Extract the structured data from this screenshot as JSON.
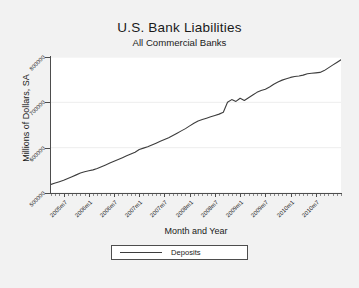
{
  "chart_data": {
    "type": "line",
    "title": "U.S. Bank Liabilities",
    "subtitle": "All Commercial Banks",
    "xlabel": "Month and Year",
    "ylabel": "Millions of Dollars, SA",
    "grid": "horizontal",
    "legend_position": "bottom-center",
    "xlim": [
      "2005m4",
      "2011m1"
    ],
    "ylim": [
      500000,
      800000
    ],
    "ytick_labels": [
      "800000",
      "700000",
      "600000",
      "500000"
    ],
    "ytick_values": [
      800000,
      700000,
      600000,
      500000
    ],
    "xtick_labels": [
      "2005m7",
      "2006m1",
      "2006m7",
      "2007m1",
      "2007m7",
      "2008m1",
      "2008m7",
      "2009m1",
      "2009m7",
      "2010m1",
      "2010m7"
    ],
    "xtick_values": [
      "2005m7",
      "2006m1",
      "2006m7",
      "2007m1",
      "2007m7",
      "2008m1",
      "2008m7",
      "2009m1",
      "2009m7",
      "2010m1",
      "2010m7"
    ],
    "series": [
      {
        "name": "Deposits",
        "color": "#3d3d3d",
        "x": [
          "2005m4",
          "2005m5",
          "2005m6",
          "2005m7",
          "2005m8",
          "2005m9",
          "2005m10",
          "2005m11",
          "2005m12",
          "2006m1",
          "2006m2",
          "2006m3",
          "2006m4",
          "2006m5",
          "2006m6",
          "2006m7",
          "2006m8",
          "2006m9",
          "2006m10",
          "2006m11",
          "2006m12",
          "2007m1",
          "2007m2",
          "2007m3",
          "2007m4",
          "2007m5",
          "2007m6",
          "2007m7",
          "2007m8",
          "2007m9",
          "2007m10",
          "2007m11",
          "2007m12",
          "2008m1",
          "2008m2",
          "2008m3",
          "2008m4",
          "2008m5",
          "2008m6",
          "2008m7",
          "2008m8",
          "2008m9",
          "2008m10",
          "2008m11",
          "2008m12",
          "2009m1",
          "2009m2",
          "2009m3",
          "2009m4",
          "2009m5",
          "2009m6",
          "2009m7",
          "2009m8",
          "2009m9",
          "2009m10",
          "2009m11",
          "2009m12",
          "2010m1",
          "2010m2",
          "2010m3",
          "2010m4",
          "2010m5",
          "2010m6",
          "2010m7",
          "2010m8",
          "2010m9",
          "2010m10",
          "2010m11",
          "2010m12",
          "2011m1"
        ],
        "values": [
          519000,
          522000,
          525000,
          528000,
          532000,
          536000,
          540000,
          544000,
          547000,
          549000,
          551000,
          554000,
          558000,
          562000,
          566000,
          570000,
          574000,
          578000,
          582000,
          586000,
          590000,
          596000,
          599000,
          602000,
          606000,
          610000,
          614000,
          618000,
          622000,
          627000,
          632000,
          637000,
          642000,
          648000,
          654000,
          659000,
          662000,
          665000,
          668000,
          671000,
          674000,
          678000,
          700000,
          706000,
          702000,
          709000,
          704000,
          710000,
          716000,
          722000,
          726000,
          729000,
          734000,
          740000,
          745000,
          749000,
          752000,
          755000,
          757000,
          758000,
          760000,
          763000,
          764000,
          765000,
          766000,
          770000,
          776000,
          782000,
          788000,
          794000
        ]
      }
    ]
  }
}
